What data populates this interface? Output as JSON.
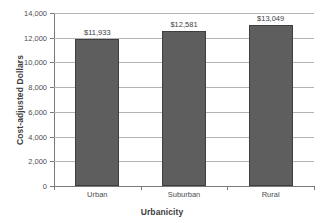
{
  "chart_data": {
    "type": "bar",
    "title": "",
    "xlabel": "Urbanicity",
    "ylabel": "Cost-adjusted Dollars",
    "categories": [
      "Urban",
      "Suburban",
      "Rural"
    ],
    "values": [
      11933,
      12581,
      13049
    ],
    "data_labels": [
      "$11,933",
      "$12,581",
      "$13,049"
    ],
    "ylim": [
      0,
      14000
    ],
    "ytick_values": [
      0,
      2000,
      4000,
      6000,
      8000,
      10000,
      12000,
      14000
    ],
    "ytick_labels": [
      "0",
      "2,000",
      "4,000",
      "6,000",
      "8,000",
      "10,000",
      "12,000",
      "14,000"
    ],
    "grid": true,
    "grid_axis": "y",
    "legend": false,
    "legend_position": "none",
    "series": [
      {
        "name": "Cost-adjusted Dollars",
        "values": [
          11933,
          12581,
          13049
        ],
        "color": "#5e5e5e"
      }
    ],
    "colors": {
      "bar_fill": "#5e5e5e",
      "bar_border": "#3f3f3f",
      "gridline": "#b4b4b4",
      "axis": "#7a7a7a",
      "text": "#4d4d4d",
      "title_text": "#3d3d3d",
      "background": "#ffffff"
    }
  }
}
